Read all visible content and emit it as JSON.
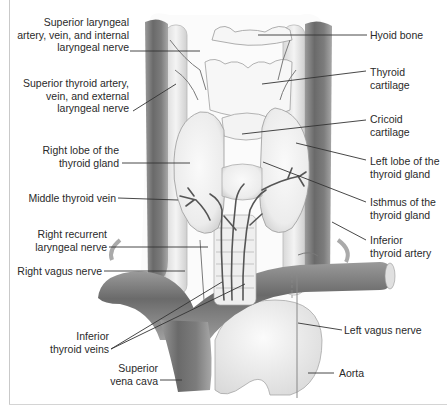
{
  "figure": {
    "colors": {
      "background": "#ffffff",
      "vessel_dark": "#6e6e6e",
      "vessel_mid": "#8c8c8c",
      "vessel_light": "#b8b8b8",
      "tissue": "#f1f1f1",
      "outline": "#9a9a9a",
      "leader_line": "#333333",
      "text": "#2a2a2a"
    }
  },
  "labels_left": [
    {
      "id": "superior-laryngeal",
      "text": "Superior laryngeal\nartery, vein, and internal\nlaryngeal nerve"
    },
    {
      "id": "superior-thyroid",
      "text": "Superior thyroid artery,\nvein, and external\nlaryngeal nerve"
    },
    {
      "id": "right-lobe",
      "text": "Right lobe of the\nthyroid gland"
    },
    {
      "id": "middle-thyroid-vein",
      "text": "Middle thyroid vein"
    },
    {
      "id": "right-recurrent-laryngeal",
      "text": "Right recurrent\nlaryngeal nerve"
    },
    {
      "id": "right-vagus",
      "text": "Right vagus nerve"
    },
    {
      "id": "inferior-thyroid-veins",
      "text": "Inferior\nthyroid veins"
    },
    {
      "id": "superior-vena-cava",
      "text": "Superior\nvena cava"
    }
  ],
  "labels_right": [
    {
      "id": "hyoid-bone",
      "text": "Hyoid bone"
    },
    {
      "id": "thyroid-cartilage",
      "text": "Thyroid\ncartilage"
    },
    {
      "id": "cricoid-cartilage",
      "text": "Cricoid\ncartilage"
    },
    {
      "id": "left-lobe",
      "text": "Left lobe of the\nthyroid gland"
    },
    {
      "id": "isthmus",
      "text": "Isthmus of the\nthyroid gland"
    },
    {
      "id": "inferior-thyroid-artery",
      "text": "Inferior\nthyroid artery"
    },
    {
      "id": "left-vagus",
      "text": "Left vagus nerve"
    },
    {
      "id": "aorta",
      "text": "Aorta"
    }
  ]
}
